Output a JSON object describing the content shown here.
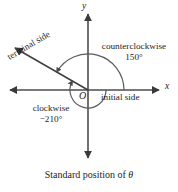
{
  "figure": {
    "caption_prefix": "Standard position of ",
    "caption_symbol": "θ",
    "background_color": "#ffffff",
    "ink_color": "#333333"
  },
  "axes": {
    "x_label": "x",
    "y_label": "y",
    "origin_label": "O"
  },
  "rays": {
    "initial_side_label": "initial side",
    "terminal_side_label": "terminal side"
  },
  "angles": {
    "counterclockwise": {
      "label": "counterclockwise",
      "value": "150°",
      "degrees": 150,
      "direction": "counterclockwise"
    },
    "clockwise": {
      "label": "clockwise",
      "value": "−210°",
      "degrees": -210,
      "direction": "clockwise"
    }
  },
  "geometry": {
    "origin_x": 88,
    "origin_y": 90,
    "terminal_angle_degrees": 150,
    "ccw_arc_radius": 36,
    "cw_arc_radius": 18
  }
}
